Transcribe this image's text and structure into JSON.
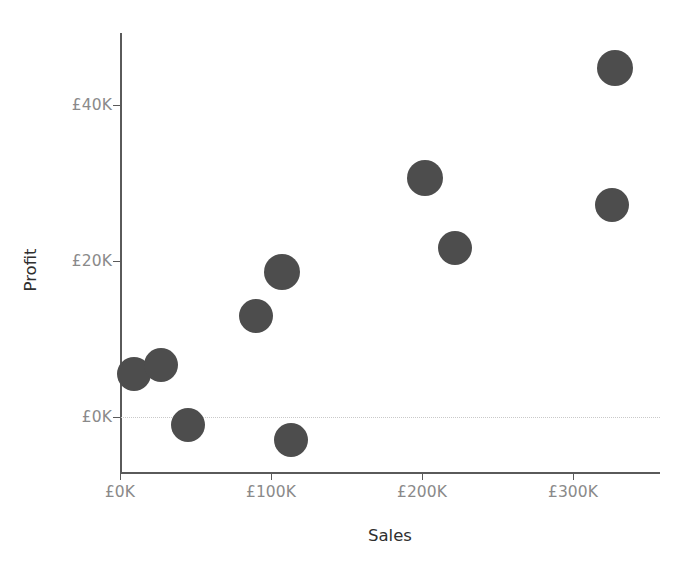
{
  "chart_data": {
    "type": "scatter",
    "title": "",
    "xlabel": "Sales",
    "ylabel": "Profit",
    "xlim": [
      -12000,
      358000
    ],
    "ylim": [
      -10000,
      50000
    ],
    "grid": false,
    "legend": null,
    "marker_color": "#4d4d4d",
    "axis_color": "#5a5a5a",
    "tick_label_color": "#8a8a8a",
    "zero_reference_line": {
      "value": 0,
      "style": "dotted",
      "color": "#c9c9c9"
    },
    "xticks": [
      {
        "value": 0,
        "label": "£0K"
      },
      {
        "value": 100000,
        "label": "£100K"
      },
      {
        "value": 200000,
        "label": "£200K"
      },
      {
        "value": 300000,
        "label": "£300K"
      }
    ],
    "yticks": [
      {
        "value": 0,
        "label": "£0K"
      },
      {
        "value": 20000,
        "label": "£20K"
      },
      {
        "value": 40000,
        "label": "£40K"
      }
    ],
    "points": [
      {
        "x": 9000,
        "y": 5500,
        "r": 17
      },
      {
        "x": 27000,
        "y": 6700,
        "r": 17
      },
      {
        "x": 45000,
        "y": -1000,
        "r": 17
      },
      {
        "x": 90000,
        "y": 13000,
        "r": 17
      },
      {
        "x": 107000,
        "y": 18600,
        "r": 18
      },
      {
        "x": 113000,
        "y": -3000,
        "r": 17
      },
      {
        "x": 202000,
        "y": 30600,
        "r": 18
      },
      {
        "x": 222000,
        "y": 21700,
        "r": 17
      },
      {
        "x": 326000,
        "y": 27200,
        "r": 17
      },
      {
        "x": 328000,
        "y": 44700,
        "r": 18
      }
    ]
  },
  "axes": {
    "x_title": "Sales",
    "y_title": "Profit"
  }
}
